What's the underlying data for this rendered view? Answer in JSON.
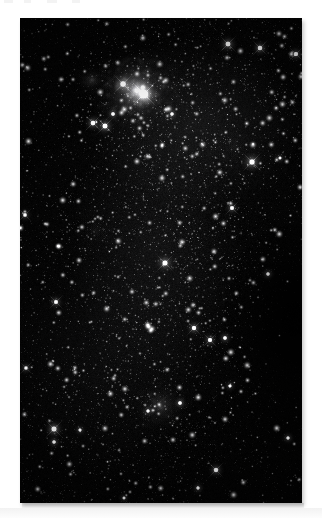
{
  "page": {
    "background_color": "#ffffff",
    "width": 322,
    "height": 518,
    "caption": "",
    "top_artifacts": [
      {
        "x": 4,
        "width": 9
      },
      {
        "x": 24,
        "width": 7
      },
      {
        "x": 47,
        "width": 10
      },
      {
        "x": 72,
        "width": 8
      }
    ]
  },
  "plate": {
    "title": "Deep sky star field photograph",
    "alt_text": "Monochrome astronomical photograph of a dense Milky Way star field containing a bright emission nebula near the top and a fainter diffuse nebula near the bottom",
    "frame": {
      "x": 20,
      "y": 18,
      "width": 282,
      "height": 485
    },
    "background_color": "#030303",
    "border_color": "#000000",
    "is_monochrome": true
  },
  "chart_data": {
    "type": "scatter",
    "xlabel": "",
    "ylabel": "",
    "xlim": [
      0,
      282
    ],
    "ylim": [
      0,
      485
    ],
    "grid": false,
    "legend": "none",
    "colormap": "grayscale",
    "background": "#030303",
    "field": {
      "star_count": 2600,
      "density_note": "density increases toward upper-right and the central band; sparser along lower-right corner",
      "noise_amplitude": 0.1
    },
    "nebulae": [
      {
        "name": "bright-emission-nebula-top",
        "cx": 116,
        "cy": 72,
        "rx": 52,
        "ry": 42,
        "peak_brightness": 0.92,
        "falloff": 0.62,
        "note": "brightest feature; compact glowing core with surrounding mottled filaments"
      },
      {
        "name": "nebula-core-knot",
        "cx": 124,
        "cy": 76,
        "rx": 16,
        "ry": 14,
        "peak_brightness": 1.0,
        "falloff": 0.5,
        "note": "unresolved bright knot at nebula centre"
      },
      {
        "name": "nebula-west-lobe",
        "cx": 72,
        "cy": 62,
        "rx": 22,
        "ry": 16,
        "peak_brightness": 0.45,
        "falloff": 0.7,
        "note": "detached fainter lobe west of the main nebula"
      },
      {
        "name": "diffuse-nebula-bottom",
        "cx": 140,
        "cy": 388,
        "rx": 38,
        "ry": 30,
        "peak_brightness": 0.46,
        "falloff": 0.75,
        "note": "soft low-surface-brightness cloud with embedded stars"
      },
      {
        "name": "faint-patch-mid-left",
        "cx": 76,
        "cy": 212,
        "rx": 30,
        "ry": 24,
        "peak_brightness": 0.2,
        "falloff": 0.85,
        "note": "very faint nebulous patch left of centre"
      },
      {
        "name": "faint-patch-upper-right",
        "cx": 214,
        "cy": 128,
        "rx": 34,
        "ry": 26,
        "peak_brightness": 0.16,
        "falloff": 0.85,
        "note": "faint glow inside the rich upper-right star cloud"
      }
    ],
    "bright_stars": [
      {
        "x": 124,
        "y": 76,
        "magnitude_rel": 1.0,
        "radius": 4.6,
        "spikes": true
      },
      {
        "x": 103,
        "y": 66,
        "magnitude_rel": 0.82,
        "radius": 3.4,
        "spikes": true
      },
      {
        "x": 232,
        "y": 144,
        "magnitude_rel": 0.8,
        "radius": 3.4,
        "spikes": true
      },
      {
        "x": 85,
        "y": 108,
        "magnitude_rel": 0.74,
        "radius": 3.1,
        "spikes": true
      },
      {
        "x": 145,
        "y": 245,
        "magnitude_rel": 0.78,
        "radius": 3.2,
        "spikes": true
      },
      {
        "x": 73,
        "y": 105,
        "magnitude_rel": 0.7,
        "radius": 2.9,
        "spikes": true
      },
      {
        "x": 34,
        "y": 411,
        "magnitude_rel": 0.76,
        "radius": 3.2,
        "spikes": true
      },
      {
        "x": 208,
        "y": 26,
        "magnitude_rel": 0.72,
        "radius": 3.0,
        "spikes": true
      },
      {
        "x": 240,
        "y": 30,
        "magnitude_rel": 0.68,
        "radius": 2.8,
        "spikes": true
      },
      {
        "x": 174,
        "y": 310,
        "magnitude_rel": 0.66,
        "radius": 2.7,
        "spikes": true
      },
      {
        "x": 190,
        "y": 322,
        "magnitude_rel": 0.62,
        "radius": 2.6,
        "spikes": true
      },
      {
        "x": 205,
        "y": 320,
        "magnitude_rel": 0.58,
        "radius": 2.4,
        "spikes": false
      },
      {
        "x": 212,
        "y": 190,
        "magnitude_rel": 0.6,
        "radius": 2.5,
        "spikes": true
      },
      {
        "x": 36,
        "y": 284,
        "magnitude_rel": 0.6,
        "radius": 2.5,
        "spikes": true
      },
      {
        "x": 196,
        "y": 452,
        "magnitude_rel": 0.64,
        "radius": 2.7,
        "spikes": true
      },
      {
        "x": 34,
        "y": 424,
        "magnitude_rel": 0.56,
        "radius": 2.3,
        "spikes": false
      },
      {
        "x": 248,
        "y": 256,
        "magnitude_rel": 0.54,
        "radius": 2.3,
        "spikes": false
      },
      {
        "x": 268,
        "y": 420,
        "magnitude_rel": 0.52,
        "radius": 2.2,
        "spikes": false
      },
      {
        "x": 5,
        "y": 197,
        "magnitude_rel": 0.56,
        "radius": 2.3,
        "spikes": true
      },
      {
        "x": 6,
        "y": 350,
        "magnitude_rel": 0.54,
        "radius": 2.2,
        "spikes": true
      },
      {
        "x": 276,
        "y": 36,
        "magnitude_rel": 0.62,
        "radius": 2.6,
        "spikes": true
      },
      {
        "x": 160,
        "y": 385,
        "magnitude_rel": 0.58,
        "radius": 2.4,
        "spikes": false
      },
      {
        "x": 128,
        "y": 393,
        "magnitude_rel": 0.52,
        "radius": 2.2,
        "spikes": false
      },
      {
        "x": 93,
        "y": 96,
        "magnitude_rel": 0.58,
        "radius": 2.4,
        "spikes": false
      },
      {
        "x": 152,
        "y": 96,
        "magnitude_rel": 0.56,
        "radius": 2.3,
        "spikes": false
      },
      {
        "x": 60,
        "y": 412,
        "magnitude_rel": 0.5,
        "radius": 2.1,
        "spikes": false
      },
      {
        "x": 210,
        "y": 368,
        "magnitude_rel": 0.5,
        "radius": 2.1,
        "spikes": false
      },
      {
        "x": 260,
        "y": 140,
        "magnitude_rel": 0.48,
        "radius": 2.0,
        "spikes": false
      },
      {
        "x": 178,
        "y": 470,
        "magnitude_rel": 0.52,
        "radius": 2.2,
        "spikes": false
      },
      {
        "x": 104,
        "y": 480,
        "magnitude_rel": 0.46,
        "radius": 2.0,
        "spikes": false
      }
    ]
  }
}
